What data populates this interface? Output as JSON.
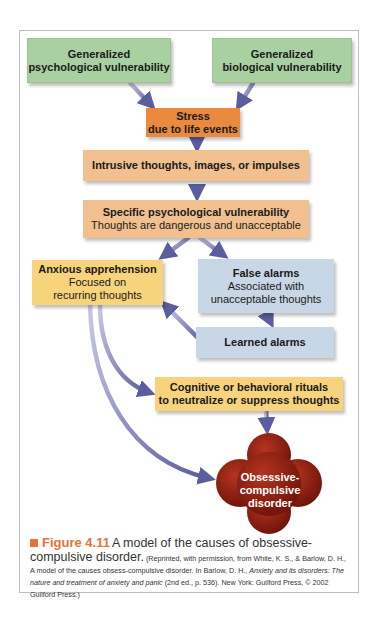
{
  "diagram": {
    "nodes": {
      "gen_psych": {
        "line1": "Generalized",
        "line2": "psychological vulnerability",
        "color": "#a9d0a0"
      },
      "gen_bio": {
        "line1": "Generalized",
        "line2": "biological vulnerability",
        "color": "#a9d0a0"
      },
      "stress": {
        "line1": "Stress",
        "line2": "due to life events",
        "color": "#e98a3e"
      },
      "intrusive": {
        "line1": "Intrusive thoughts, images, or impulses",
        "color": "#f2c08f"
      },
      "specific": {
        "line1": "Specific psychological vulnerability",
        "line2": "Thoughts are dangerous and unacceptable",
        "color": "#f2c08f"
      },
      "anxious": {
        "line1": "Anxious apprehension",
        "line2": "Focused on",
        "line3": "recurring thoughts",
        "color": "#f7d37c"
      },
      "false_alarms": {
        "line1": "False alarms",
        "line2": "Associated with",
        "line3": "unacceptable thoughts",
        "color": "#c8d7e6"
      },
      "learned": {
        "line1": "Learned alarms",
        "color": "#c8d7e6"
      },
      "rituals": {
        "line1": "Cognitive or behavioral rituals",
        "line2": "to neutralize or suppress thoughts",
        "color": "#f7d37c"
      },
      "ocd": {
        "line1": "Obsessive-",
        "line2": "compulsive",
        "line3": "disorder",
        "color": "#8e1d12"
      }
    },
    "edges": [
      [
        "gen_psych",
        "stress"
      ],
      [
        "gen_bio",
        "stress"
      ],
      [
        "stress",
        "intrusive"
      ],
      [
        "intrusive",
        "specific"
      ],
      [
        "specific",
        "anxious"
      ],
      [
        "specific",
        "false_alarms"
      ],
      [
        "false_alarms",
        "learned"
      ],
      [
        "learned",
        "anxious"
      ],
      [
        "anxious",
        "rituals"
      ],
      [
        "anxious",
        "ocd"
      ],
      [
        "rituals",
        "ocd"
      ]
    ]
  },
  "caption": {
    "label": "Figure 4.11",
    "title": "A model of the causes of obsessive-compulsive disorder.",
    "title_a": "A model of the causes of obsessive-",
    "title_b": "compulsive disorder.",
    "credit_a": "(Reprinted, with permission, from White, K. S., & Barlow, D. H., A model of the causes obsess-compulsive disorder. In Barlow, D. H., ",
    "credit_book": "Anxiety and its disorders: The nature and treatment of anxiety and panic",
    "credit_b": " (2nd ed., p. 536). New York: Guilford Press, © 2002 Guilford Press.)",
    "accent": "#e6743a"
  }
}
